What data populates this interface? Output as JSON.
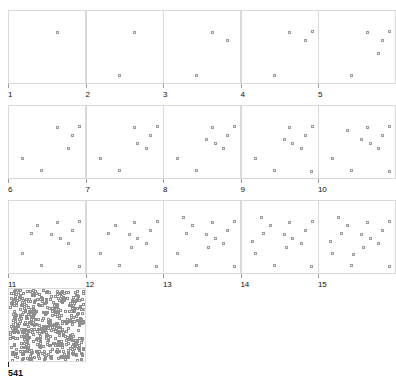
{
  "figure": {
    "title": "",
    "background_color": "#ffffff",
    "panel_border_color": "#d9d9d9",
    "marker_color": "#9c9c9c",
    "label_color": "#111111"
  },
  "chart_data": {
    "type": "scatter",
    "title": "",
    "subtitle": "",
    "xlabel": "",
    "ylabel": "",
    "xlim": [
      0,
      1
    ],
    "ylim": [
      0,
      1
    ],
    "grid": false,
    "legend": null,
    "layout": {
      "rows": 3,
      "cols": 5,
      "plus_summary_panel": true,
      "panel_width": 78,
      "panel_height": 74,
      "marker_style": "open square",
      "marker_size_px": 3
    },
    "note": "Panel N displays N accumulated points; points are cumulative across panels. Final summary panel shows 541 points.",
    "panels": [
      {
        "label": "1",
        "count": 1,
        "points": [
          [
            0.63,
            0.74
          ]
        ]
      },
      {
        "label": "2",
        "count": 2,
        "points": [
          [
            0.63,
            0.74
          ],
          [
            0.41,
            0.08
          ]
        ]
      },
      {
        "label": "3",
        "count": 3,
        "points": [
          [
            0.63,
            0.74
          ],
          [
            0.41,
            0.08
          ],
          [
            0.86,
            0.62
          ]
        ]
      },
      {
        "label": "4",
        "count": 4,
        "points": [
          [
            0.63,
            0.74
          ],
          [
            0.41,
            0.08
          ],
          [
            0.86,
            0.62
          ],
          [
            0.96,
            0.76
          ]
        ]
      },
      {
        "label": "5",
        "count": 5,
        "points": [
          [
            0.63,
            0.74
          ],
          [
            0.41,
            0.08
          ],
          [
            0.86,
            0.62
          ],
          [
            0.96,
            0.76
          ],
          [
            0.8,
            0.42
          ]
        ]
      },
      {
        "label": "6",
        "count": 6,
        "points": [
          [
            0.63,
            0.74
          ],
          [
            0.41,
            0.08
          ],
          [
            0.86,
            0.62
          ],
          [
            0.96,
            0.76
          ],
          [
            0.8,
            0.42
          ],
          [
            0.13,
            0.26
          ]
        ]
      },
      {
        "label": "7",
        "count": 7,
        "points": [
          [
            0.63,
            0.74
          ],
          [
            0.41,
            0.08
          ],
          [
            0.86,
            0.62
          ],
          [
            0.96,
            0.76
          ],
          [
            0.8,
            0.42
          ],
          [
            0.13,
            0.26
          ],
          [
            0.68,
            0.5
          ]
        ]
      },
      {
        "label": "8",
        "count": 8,
        "points": [
          [
            0.63,
            0.74
          ],
          [
            0.41,
            0.08
          ],
          [
            0.86,
            0.62
          ],
          [
            0.96,
            0.76
          ],
          [
            0.8,
            0.42
          ],
          [
            0.13,
            0.26
          ],
          [
            0.68,
            0.5
          ],
          [
            0.55,
            0.56
          ]
        ]
      },
      {
        "label": "9",
        "count": 9,
        "points": [
          [
            0.63,
            0.74
          ],
          [
            0.41,
            0.08
          ],
          [
            0.86,
            0.62
          ],
          [
            0.96,
            0.76
          ],
          [
            0.8,
            0.42
          ],
          [
            0.13,
            0.26
          ],
          [
            0.68,
            0.5
          ],
          [
            0.55,
            0.56
          ],
          [
            0.95,
            0.06
          ]
        ]
      },
      {
        "label": "10",
        "count": 10,
        "points": [
          [
            0.63,
            0.74
          ],
          [
            0.41,
            0.08
          ],
          [
            0.86,
            0.62
          ],
          [
            0.96,
            0.76
          ],
          [
            0.8,
            0.42
          ],
          [
            0.13,
            0.26
          ],
          [
            0.68,
            0.5
          ],
          [
            0.55,
            0.56
          ],
          [
            0.95,
            0.06
          ],
          [
            0.35,
            0.7
          ]
        ]
      },
      {
        "label": "11",
        "count": 11,
        "points": [
          [
            0.63,
            0.74
          ],
          [
            0.41,
            0.08
          ],
          [
            0.86,
            0.62
          ],
          [
            0.96,
            0.76
          ],
          [
            0.8,
            0.42
          ],
          [
            0.13,
            0.26
          ],
          [
            0.68,
            0.5
          ],
          [
            0.55,
            0.56
          ],
          [
            0.95,
            0.06
          ],
          [
            0.35,
            0.7
          ],
          [
            0.26,
            0.57
          ]
        ]
      },
      {
        "label": "12",
        "count": 12,
        "points": [
          [
            0.63,
            0.74
          ],
          [
            0.41,
            0.08
          ],
          [
            0.86,
            0.62
          ],
          [
            0.96,
            0.76
          ],
          [
            0.8,
            0.42
          ],
          [
            0.13,
            0.26
          ],
          [
            0.68,
            0.5
          ],
          [
            0.55,
            0.56
          ],
          [
            0.95,
            0.06
          ],
          [
            0.35,
            0.7
          ],
          [
            0.26,
            0.57
          ],
          [
            0.58,
            0.36
          ]
        ]
      },
      {
        "label": "13",
        "count": 13,
        "points": [
          [
            0.63,
            0.74
          ],
          [
            0.41,
            0.08
          ],
          [
            0.86,
            0.62
          ],
          [
            0.96,
            0.76
          ],
          [
            0.8,
            0.42
          ],
          [
            0.13,
            0.26
          ],
          [
            0.68,
            0.5
          ],
          [
            0.55,
            0.56
          ],
          [
            0.95,
            0.06
          ],
          [
            0.35,
            0.7
          ],
          [
            0.26,
            0.57
          ],
          [
            0.58,
            0.36
          ],
          [
            0.22,
            0.82
          ]
        ]
      },
      {
        "label": "14",
        "count": 14,
        "points": [
          [
            0.63,
            0.74
          ],
          [
            0.41,
            0.08
          ],
          [
            0.86,
            0.62
          ],
          [
            0.96,
            0.76
          ],
          [
            0.8,
            0.42
          ],
          [
            0.13,
            0.26
          ],
          [
            0.68,
            0.5
          ],
          [
            0.55,
            0.56
          ],
          [
            0.95,
            0.06
          ],
          [
            0.35,
            0.7
          ],
          [
            0.26,
            0.57
          ],
          [
            0.58,
            0.36
          ],
          [
            0.22,
            0.82
          ],
          [
            0.1,
            0.44
          ]
        ]
      },
      {
        "label": "15",
        "count": 15,
        "points": [
          [
            0.63,
            0.74
          ],
          [
            0.41,
            0.08
          ],
          [
            0.86,
            0.62
          ],
          [
            0.96,
            0.76
          ],
          [
            0.8,
            0.42
          ],
          [
            0.13,
            0.26
          ],
          [
            0.68,
            0.5
          ],
          [
            0.55,
            0.56
          ],
          [
            0.95,
            0.06
          ],
          [
            0.35,
            0.7
          ],
          [
            0.26,
            0.57
          ],
          [
            0.58,
            0.36
          ],
          [
            0.22,
            0.82
          ],
          [
            0.1,
            0.44
          ],
          [
            0.44,
            0.24
          ]
        ]
      }
    ],
    "summary_panel": {
      "label": "541",
      "count": 541,
      "density": "saturated",
      "width": 78,
      "height": 74
    }
  }
}
